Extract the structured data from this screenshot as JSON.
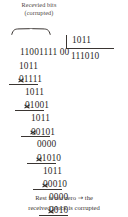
{
  "caption": {
    "line1": "Recevied bits",
    "line2": "(corrupted)"
  },
  "division": {
    "dividend": "11001111 00",
    "divisor": "1011",
    "quotient": "111010",
    "steps": [
      {
        "cancelled": "",
        "digits": "1011",
        "underline": true
      },
      {
        "cancelled": "0",
        "digits": "1111",
        "underline": false
      },
      {
        "cancelled": "",
        "digits": "1011",
        "underline": true
      },
      {
        "cancelled": "0",
        "digits": "1001",
        "underline": false
      },
      {
        "cancelled": "",
        "digits": "1011",
        "underline": true
      },
      {
        "cancelled": "0",
        "digits": "0101",
        "underline": false
      },
      {
        "cancelled": "",
        "digits": "0000",
        "underline": true
      },
      {
        "cancelled": "0",
        "digits": "1010",
        "underline": false
      },
      {
        "cancelled": "",
        "digits": "1011",
        "underline": true
      },
      {
        "cancelled": "0",
        "digits": "0010",
        "underline": false
      },
      {
        "cancelled": "",
        "digits": "0000",
        "underline": true
      },
      {
        "cancelled": "0",
        "digits": "010",
        "underline": false
      }
    ]
  },
  "conclusion": {
    "line1_pre": "Rest is not zero ",
    "arrow": "→",
    "line1_post": " the",
    "line2": "received block is corrupted"
  },
  "colors": {
    "ink": "#2e2a28",
    "caption": "#4a4442",
    "rule": "#3a3532",
    "background": "#ffffff"
  }
}
